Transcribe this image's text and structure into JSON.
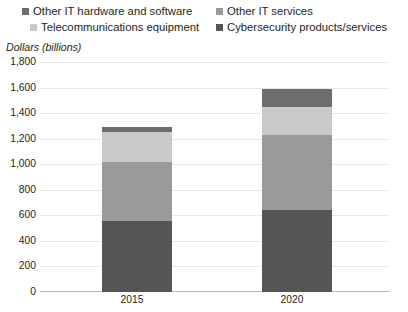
{
  "legend": {
    "items": [
      {
        "label": "Other IT hardware and software",
        "color": "#6d6d6d",
        "key": "other_it_hardware_and_software"
      },
      {
        "label": "Other IT services",
        "color": "#9a9a9a",
        "key": "other_it_services"
      },
      {
        "label": "Telecommunications equipment",
        "color": "#c9c9c9",
        "key": "telecommunications_equipment"
      },
      {
        "label": "Cybersecurity products/services",
        "color": "#555555",
        "key": "cybersecurity_products_services"
      }
    ]
  },
  "axis_title": "Dollars (billions)",
  "y_ticks": [
    "1,800",
    "1,600",
    "1,400",
    "1,200",
    "1,000",
    "800",
    "600",
    "400",
    "200",
    "0"
  ],
  "x_ticks": [
    "2015",
    "2020"
  ],
  "chart_data": {
    "type": "bar",
    "title": "",
    "subtitle": "",
    "xlabel": "",
    "ylabel": "Dollars (billions)",
    "ylim": [
      0,
      1800
    ],
    "ytick_step": 200,
    "grid": true,
    "stacked": true,
    "legend_position": "top",
    "categories": [
      "2015",
      "2020"
    ],
    "series": [
      {
        "name": "Cybersecurity products/services",
        "color": "#555555",
        "values": [
          555,
          645
        ]
      },
      {
        "name": "Other IT services",
        "color": "#9a9a9a",
        "values": [
          465,
          585
        ]
      },
      {
        "name": "Telecommunications equipment",
        "color": "#c9c9c9",
        "values": [
          230,
          220
        ]
      },
      {
        "name": "Other IT hardware and software",
        "color": "#6d6d6d",
        "values": [
          40,
          140
        ]
      }
    ],
    "totals": [
      1290,
      1590
    ]
  }
}
